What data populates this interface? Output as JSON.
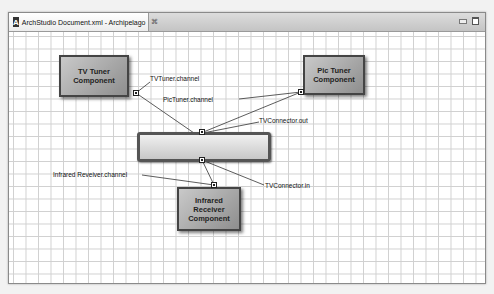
{
  "window": {
    "tab_title": "ArchStudio Document.xml - Archipelago",
    "app_icon": "A",
    "tab_close_glyph": "⌘"
  },
  "diagram": {
    "components": [
      {
        "id": "tv-tuner",
        "line1": "TV Tuner",
        "line2": "Component"
      },
      {
        "id": "pic-tuner",
        "line1": "Pic Tuner",
        "line2": "Component"
      },
      {
        "id": "infrared",
        "line1": "Infrared Receiver",
        "line2": "Component"
      }
    ],
    "connector": {
      "id": "tv-connector",
      "label": ""
    },
    "labels": {
      "tv_channel": "TVTuner.channel",
      "pic_channel": "PicTuner.channel",
      "conn_out": "TVConnector.out",
      "conn_in": "TVConnector.in",
      "ir_channel": "Infrared Reveiver.channel"
    },
    "colors": {
      "component_fill": "#a8a8a8",
      "connector_fill": "#e0e0e0",
      "wire": "#333333",
      "grid": "#d0d0d0"
    }
  }
}
